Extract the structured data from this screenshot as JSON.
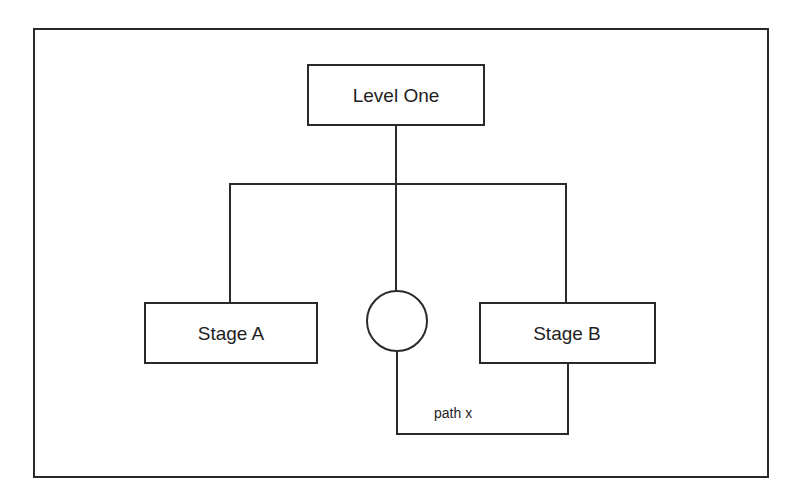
{
  "diagram": {
    "type": "hierarchy",
    "colors": {
      "stroke": "#2a2a2a",
      "text": "#1e1e1e",
      "background": "#ffffff"
    },
    "nodes": {
      "level_one": {
        "label": "Level One"
      },
      "stage_a": {
        "label": "Stage A"
      },
      "stage_b": {
        "label": "Stage B"
      },
      "circle": {
        "label": ""
      }
    },
    "edges": [
      {
        "from": "level_one",
        "to": "stage_a"
      },
      {
        "from": "level_one",
        "to": "circle"
      },
      {
        "from": "level_one",
        "to": "stage_b"
      },
      {
        "from": "circle",
        "to": "stage_b",
        "label": "path x"
      }
    ],
    "path_label": "path x"
  }
}
